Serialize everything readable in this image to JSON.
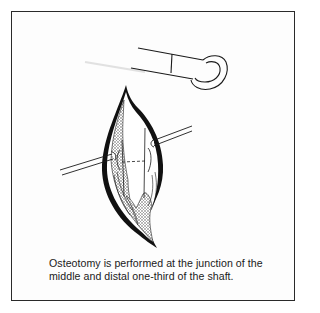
{
  "figure": {
    "caption": {
      "line1": "Osteotomy is performed at the junction of the",
      "line2": "middle and distal one-third of the shaft."
    },
    "elements": {
      "instrument": "hook-retractor-instrument",
      "incision": "surgical-incision-exposing-bone-shaft",
      "retractors": [
        "left-retractor-pin",
        "right-retractor-pin"
      ],
      "osteotomy_marker": "dashed-osteotomy-line"
    },
    "colors": {
      "line": "#1a1a1a",
      "background": "#ffffff",
      "border": "#2a2a2a"
    }
  }
}
